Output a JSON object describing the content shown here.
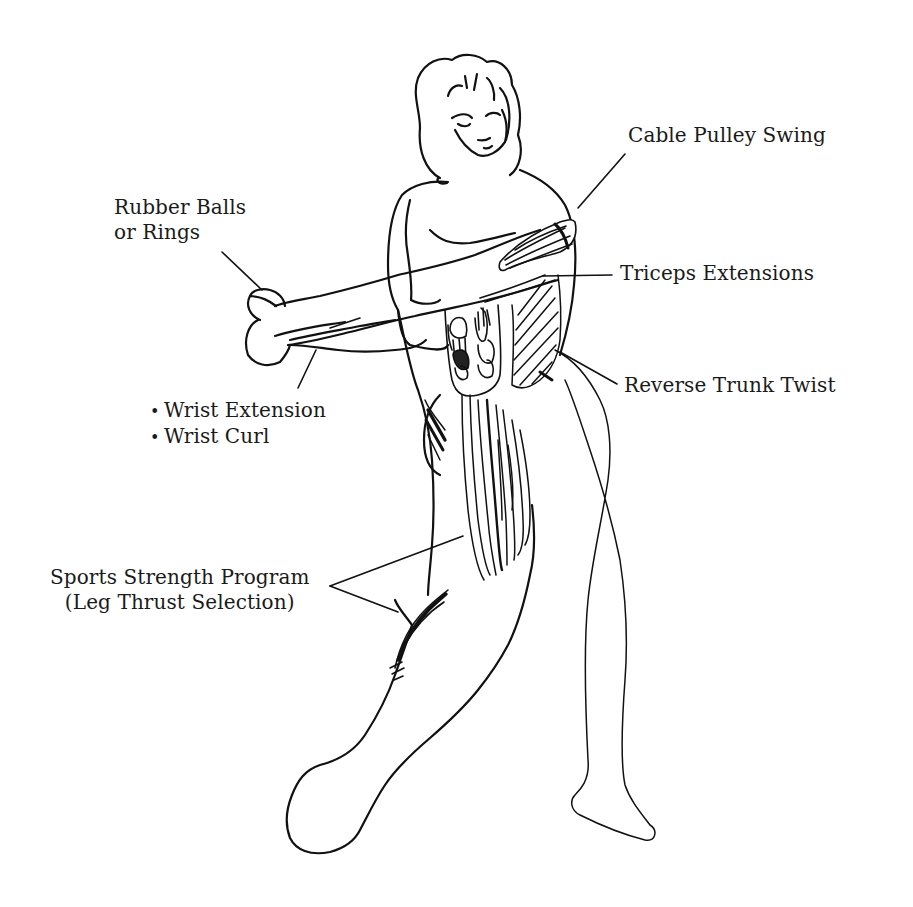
{
  "diagram": {
    "type": "anatomical exercise illustration",
    "line_color": "#111111",
    "background": "#ffffff"
  },
  "labels": {
    "cable_pulley_swing": "Cable  Pulley Swing",
    "rubber_balls_line1": "Rubber Balls",
    "rubber_balls_line2": "or Rings",
    "triceps_extensions": "Triceps Extensions",
    "reverse_trunk_twist": "Reverse Trunk Twist",
    "wrist_items": [
      "Wrist Extension",
      "Wrist Curl"
    ],
    "sports_strength_line1": "Sports Strength Program",
    "sports_strength_line2": "(Leg Thrust Selection)"
  }
}
